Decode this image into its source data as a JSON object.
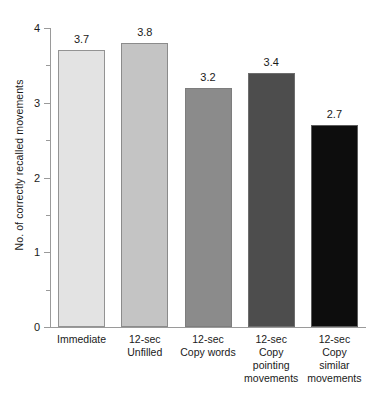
{
  "chart_data": {
    "type": "bar",
    "title": "",
    "subtitle": "",
    "xlabel": "",
    "ylabel": "No. of correctly recalled movements",
    "ylim": [
      0,
      4
    ],
    "y_major_ticks": [
      0,
      1,
      2,
      3,
      4
    ],
    "y_minor_ticks": [
      0.5,
      1.5,
      2.5,
      3.5
    ],
    "y_tick_labels": [
      "0",
      "1",
      "2",
      "3",
      "4"
    ],
    "grid": false,
    "legend": false,
    "legend_position": "none",
    "categories": [
      "Immediate",
      "12-sec Unfilled",
      "12-sec Copy words",
      "12-sec Copy pointing movements",
      "12-sec Copy similar movements"
    ],
    "category_label_lines": [
      [
        "Immediate"
      ],
      [
        "12-sec",
        "Unfilled"
      ],
      [
        "12-sec",
        "Copy words"
      ],
      [
        "12-sec",
        "Copy",
        "pointing",
        "movements"
      ],
      [
        "12-sec",
        "Copy",
        "similar",
        "movements"
      ]
    ],
    "values": [
      3.7,
      3.8,
      3.2,
      3.4,
      2.7
    ],
    "value_labels": [
      "3.7",
      "3.8",
      "3.2",
      "3.4",
      "2.7"
    ],
    "bar_colors": [
      "#e3e3e3",
      "#c4c4c4",
      "#8b8b8b",
      "#4d4d4d",
      "#0d0d0d"
    ],
    "axis_color": "#9a9a9a",
    "text_color": "#1a1a1a",
    "background": "#ffffff"
  }
}
